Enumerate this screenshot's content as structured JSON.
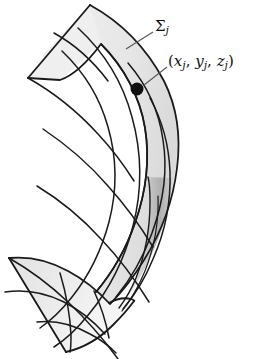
{
  "figure": {
    "kind": "mathematical-surface-diagram",
    "background_color": "#ffffff",
    "line_color": "#1a1a1a",
    "fill_light": "#ececec",
    "fill_mid": "#d9d9d9",
    "fill_shadow": "#b4b4b4",
    "dot_color": "#111111"
  },
  "labels": {
    "surface": {
      "text": "Σ",
      "subscript": "j",
      "full": "Σⱼ",
      "name": "surface-patch-label"
    },
    "sample_point": {
      "open_paren": "(",
      "x": "x",
      "x_sub": "j",
      "comma1": ", ",
      "y": "y",
      "y_sub": "j",
      "comma2": ", ",
      "z": "z",
      "z_sub": "j",
      "close_paren": ")",
      "full": "(xⱼ, yⱼ, zⱼ)",
      "name": "sample-point-label"
    }
  },
  "annotations": {
    "leader_sigma": {
      "from_x": 126,
      "from_y": 49,
      "to_x": 153,
      "to_y": 32
    },
    "leader_point": {
      "from_x": 144,
      "from_y": 85,
      "to_x": 167,
      "to_y": 67
    },
    "marker_dot": {
      "cx": 137,
      "cy": 89,
      "r": 6.5
    }
  }
}
